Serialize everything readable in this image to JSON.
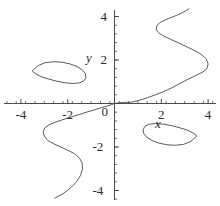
{
  "chart_data": {
    "type": "line",
    "title": "",
    "subtitle": "",
    "xlabel": "x",
    "ylabel": "y",
    "xlim": [
      -4.6,
      4.4
    ],
    "ylim": [
      -4.4,
      4.4
    ],
    "grid": false,
    "legend": null,
    "annotations": [],
    "axis_color": "#3a3a3a",
    "curve_color": "#4a4a4a",
    "curve_width": 0.9,
    "x_ticks": [
      {
        "value": -4,
        "label": "-4"
      },
      {
        "value": -2,
        "label": "-2"
      },
      {
        "value": 0,
        "label": "0"
      },
      {
        "value": 2,
        "label": "2"
      },
      {
        "value": 4,
        "label": "4"
      }
    ],
    "y_ticks": [
      {
        "value": 4,
        "label": "4"
      },
      {
        "value": 2,
        "label": "2"
      },
      {
        "value": 0,
        "label": "0"
      },
      {
        "value": -2,
        "label": "-2"
      },
      {
        "value": -4,
        "label": "-4"
      }
    ],
    "minor_tick_interval": 0.4,
    "series": [
      {
        "name": "central-branch",
        "closed": false,
        "points": [
          [
            -2.55,
            -4.35
          ],
          [
            -2.2,
            -4.15
          ],
          [
            -1.9,
            -3.9
          ],
          [
            -1.62,
            -3.6
          ],
          [
            -1.45,
            -3.3
          ],
          [
            -1.37,
            -3.0
          ],
          [
            -1.38,
            -2.75
          ],
          [
            -1.5,
            -2.5
          ],
          [
            -1.72,
            -2.3
          ],
          [
            -2.0,
            -2.15
          ],
          [
            -2.3,
            -2.0
          ],
          [
            -2.6,
            -1.85
          ],
          [
            -2.85,
            -1.7
          ],
          [
            -3.0,
            -1.5
          ],
          [
            -3.05,
            -1.3
          ],
          [
            -2.98,
            -1.12
          ],
          [
            -2.8,
            -0.98
          ],
          [
            -2.55,
            -0.87
          ],
          [
            -2.25,
            -0.76
          ],
          [
            -1.9,
            -0.64
          ],
          [
            -1.55,
            -0.52
          ],
          [
            -1.2,
            -0.4
          ],
          [
            -0.85,
            -0.29
          ],
          [
            -0.55,
            -0.19
          ],
          [
            -0.3,
            -0.11
          ],
          [
            -0.12,
            -0.05
          ],
          [
            0.0,
            0.0
          ],
          [
            0.18,
            0.03
          ],
          [
            0.42,
            0.05
          ],
          [
            0.72,
            0.06
          ],
          [
            1.05,
            0.14
          ],
          [
            1.4,
            0.26
          ],
          [
            1.75,
            0.4
          ],
          [
            2.1,
            0.55
          ],
          [
            2.45,
            0.72
          ],
          [
            2.8,
            0.92
          ],
          [
            3.15,
            1.12
          ],
          [
            3.5,
            1.3
          ],
          [
            3.78,
            1.45
          ],
          [
            3.95,
            1.6
          ],
          [
            4.0,
            1.82
          ],
          [
            3.92,
            2.05
          ],
          [
            3.72,
            2.25
          ],
          [
            3.45,
            2.42
          ],
          [
            3.1,
            2.6
          ],
          [
            2.75,
            2.78
          ],
          [
            2.4,
            2.95
          ],
          [
            2.1,
            3.1
          ],
          [
            1.88,
            3.25
          ],
          [
            1.78,
            3.42
          ],
          [
            1.82,
            3.6
          ],
          [
            2.0,
            3.76
          ],
          [
            2.3,
            3.9
          ],
          [
            2.65,
            4.05
          ],
          [
            2.95,
            4.2
          ],
          [
            3.18,
            4.35
          ]
        ]
      },
      {
        "name": "upper-left-loop",
        "closed": true,
        "points": [
          [
            -3.5,
            1.52
          ],
          [
            -3.25,
            1.75
          ],
          [
            -2.95,
            1.88
          ],
          [
            -2.6,
            1.92
          ],
          [
            -2.25,
            1.9
          ],
          [
            -1.9,
            1.82
          ],
          [
            -1.6,
            1.7
          ],
          [
            -1.38,
            1.55
          ],
          [
            -1.25,
            1.38
          ],
          [
            -1.22,
            1.2
          ],
          [
            -1.3,
            1.05
          ],
          [
            -1.48,
            0.95
          ],
          [
            -1.75,
            0.92
          ],
          [
            -2.1,
            0.95
          ],
          [
            -2.45,
            1.02
          ],
          [
            -2.8,
            1.12
          ],
          [
            -3.1,
            1.22
          ],
          [
            -3.35,
            1.35
          ],
          [
            -3.48,
            1.45
          ]
        ]
      },
      {
        "name": "lower-right-loop",
        "closed": true,
        "points": [
          [
            3.5,
            -1.52
          ],
          [
            3.25,
            -1.75
          ],
          [
            2.95,
            -1.88
          ],
          [
            2.6,
            -1.92
          ],
          [
            2.25,
            -1.9
          ],
          [
            1.9,
            -1.82
          ],
          [
            1.6,
            -1.7
          ],
          [
            1.38,
            -1.55
          ],
          [
            1.25,
            -1.38
          ],
          [
            1.22,
            -1.2
          ],
          [
            1.3,
            -1.05
          ],
          [
            1.48,
            -0.95
          ],
          [
            1.75,
            -0.92
          ],
          [
            2.1,
            -0.95
          ],
          [
            2.45,
            -1.02
          ],
          [
            2.8,
            -1.12
          ],
          [
            3.1,
            -1.22
          ],
          [
            3.35,
            -1.35
          ],
          [
            3.48,
            -1.45
          ]
        ]
      }
    ]
  }
}
